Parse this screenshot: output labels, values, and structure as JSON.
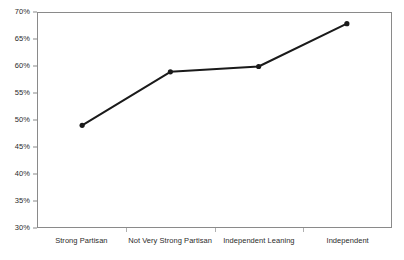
{
  "chart_data": {
    "type": "line",
    "title": "",
    "subtitle": "",
    "xlabel": "",
    "ylabel": "",
    "categories": [
      "Strong Partisan",
      "Not Very Strong Partisan",
      "Independent Leaning",
      "Independent"
    ],
    "values": [
      49,
      59,
      60,
      68
    ],
    "series": [
      {
        "name": "",
        "values": [
          49,
          59,
          60,
          68
        ]
      }
    ],
    "ylim": [
      30,
      70
    ],
    "ytick_step": 5,
    "ytick_labels": [
      "70%",
      "65%",
      "60%",
      "55%",
      "50%",
      "45%",
      "40%",
      "35%",
      "30%"
    ],
    "ytick_values": [
      70,
      65,
      60,
      55,
      50,
      45,
      40,
      35,
      30
    ],
    "grid": false,
    "legend": false,
    "legend_position": "none",
    "value_format": "percent",
    "marker": "circle",
    "line_color": "#1a1a1a",
    "marker_color": "#1a1a1a",
    "axis_color": "#8a8a8a",
    "background_color": "#ffffff"
  }
}
